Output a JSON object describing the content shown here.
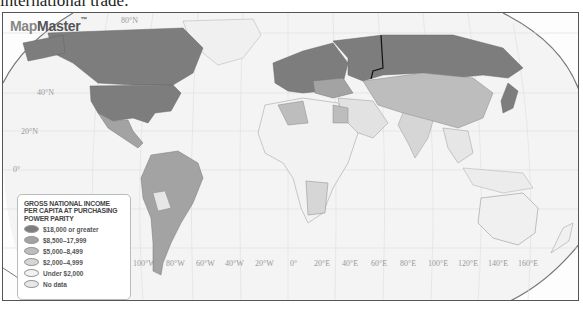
{
  "caption": "international trade.",
  "map": {
    "logo": {
      "prefix": "Map",
      "suffix": "Master",
      "tm": "™"
    },
    "latitude_labels": [
      {
        "label": "80°N",
        "x": 118,
        "y": 3
      },
      {
        "label": "40°N",
        "x": 34,
        "y": 79
      },
      {
        "label": "20°N",
        "x": 18,
        "y": 118
      },
      {
        "label": "0°",
        "x": 10,
        "y": 156
      }
    ],
    "longitude_labels": [
      "100°W",
      "80°W",
      "60°W",
      "40°W",
      "20°W",
      "0°",
      "20°E",
      "40°E",
      "60°E",
      "80°E",
      "100°E",
      "120°E",
      "140°E",
      "160°E"
    ],
    "legend": {
      "title": "GROSS NATIONAL INCOME PER CAPITA AT PURCHASING POWER PARITY",
      "items": [
        {
          "label": "$18,000 or greater",
          "color": "#7d7d7d"
        },
        {
          "label": "$8,500–17,999",
          "color": "#a3a3a3"
        },
        {
          "label": "$5,000–8,499",
          "color": "#bdbdbd"
        },
        {
          "label": "$2,000–4,999",
          "color": "#d6d6d6"
        },
        {
          "label": "Under $2,000",
          "color": "#f2f2f2"
        },
        {
          "label": "No data",
          "color": "#e8e8e8"
        }
      ]
    }
  }
}
